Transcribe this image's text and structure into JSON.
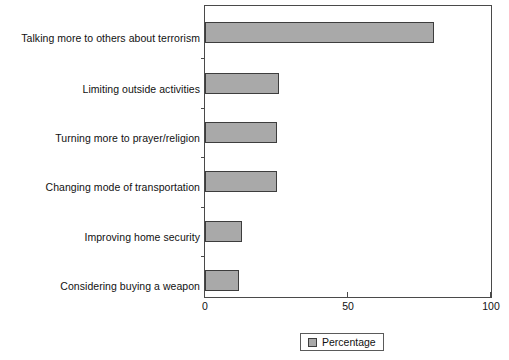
{
  "chart_data": {
    "type": "bar",
    "orientation": "horizontal",
    "title": "",
    "xlabel": "",
    "ylabel": "",
    "xlim": [
      0,
      100
    ],
    "xticks": [
      0,
      50,
      100
    ],
    "xticklabels": [
      "0",
      "50",
      "100"
    ],
    "grid": false,
    "legend": {
      "position": "bottom-center",
      "entries": [
        {
          "name": "Percentage",
          "color": "#a9a9a9"
        }
      ]
    },
    "categories": [
      "Talking more to others about terrorism",
      "Limiting outside activities",
      "Turning more to prayer/religion",
      "Changing mode of transportation",
      "Improving home security",
      "Considering buying a weapon"
    ],
    "series": [
      {
        "name": "Percentage",
        "values": [
          80,
          26,
          25,
          25,
          13,
          12
        ]
      }
    ]
  },
  "colors": {
    "bar_fill": "#a9a9a9",
    "bar_edge": "#3d3d3d",
    "axis": "#4a4a4a",
    "text": "#111111",
    "background": "#ffffff"
  }
}
